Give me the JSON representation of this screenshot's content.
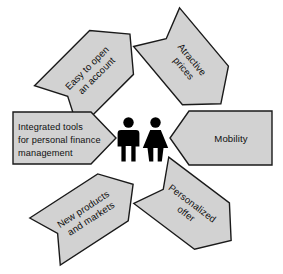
{
  "diagram": {
    "background_color": "#ffffff",
    "arrow_fill_color": "#d2d2d2",
    "arrow_stroke_color": "#1a1a1a",
    "text_color": "#101010",
    "figure_color": "#000000",
    "center": {
      "male_figure_label": "man-pictogram",
      "female_figure_label": "woman-pictogram"
    },
    "arrows": [
      {
        "id": "easy-to-open-an-account",
        "position": "top-left",
        "rotation_deg": -45,
        "lines": [
          "Easy to open",
          "an account"
        ]
      },
      {
        "id": "atractive-prices",
        "position": "top-right",
        "rotation_deg": 50,
        "lines": [
          "Atractive",
          "prices"
        ]
      },
      {
        "id": "integrated-tools-for-personal-finance-management",
        "position": "left",
        "rotation_deg": 0,
        "lines": [
          "Integrated tools",
          "for personal finance",
          "management"
        ]
      },
      {
        "id": "mobility",
        "position": "right",
        "rotation_deg": 0,
        "lines": [
          "Mobility"
        ]
      },
      {
        "id": "new-products-and-markets",
        "position": "bottom-left",
        "rotation_deg": -33,
        "lines": [
          "New products",
          "and markets"
        ]
      },
      {
        "id": "personalized-offer",
        "position": "bottom-right",
        "rotation_deg": 37,
        "lines": [
          "Personalized",
          "offer"
        ]
      }
    ]
  }
}
